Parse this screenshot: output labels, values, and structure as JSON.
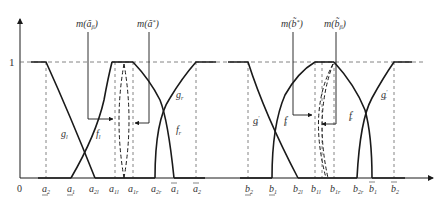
{
  "diagram": {
    "type": "fuzzy-membership-functions",
    "y_axis": {
      "origin_label": "0",
      "one_label": "1"
    },
    "left_panel": {
      "top_labels": [
        {
          "id": "m_a_beta",
          "text": "m(ã",
          "sub": "β",
          "close": ")"
        },
        {
          "id": "m_a_star",
          "text": "m(ã",
          "sup": "*",
          "close": ")"
        }
      ],
      "curve_labels": [
        {
          "id": "g_l",
          "base": "g",
          "sub": "l"
        },
        {
          "id": "f_l",
          "base": "f",
          "sub": "l"
        },
        {
          "id": "g_r",
          "base": "g",
          "sub": "r"
        },
        {
          "id": "f_r",
          "base": "f",
          "sub": "r"
        }
      ],
      "x_ticks": [
        {
          "base": "a",
          "sub": "2",
          "mark": "underline"
        },
        {
          "base": "a",
          "sub": "1",
          "mark": "underline"
        },
        {
          "base": "a",
          "sub": "2l",
          "mark": ""
        },
        {
          "base": "a",
          "sub": "1l",
          "mark": ""
        },
        {
          "base": "a",
          "sub": "1r",
          "mark": ""
        },
        {
          "base": "a",
          "sub": "2r",
          "mark": ""
        },
        {
          "base": "a",
          "sub": "1",
          "mark": "overline"
        },
        {
          "base": "a",
          "sub": "2",
          "mark": "overline"
        }
      ]
    },
    "right_panel": {
      "top_labels": [
        {
          "id": "m_b_star",
          "text": "m(b̃",
          "sup": "*",
          "close": ")"
        },
        {
          "id": "m_b_beta",
          "text": "m(b̃",
          "sub": "β",
          "close": ")"
        }
      ],
      "curve_labels": [
        {
          "id": "g_l_prime",
          "base": "g",
          "sub": "l",
          "prime": "′"
        },
        {
          "id": "f_l_prime",
          "base": "f",
          "sub": "l",
          "prime": "′"
        },
        {
          "id": "f_r_prime",
          "base": "f",
          "sub": "r",
          "prime": "′"
        },
        {
          "id": "g_r_prime",
          "base": "g",
          "sub": "r",
          "prime": "′"
        }
      ],
      "x_ticks": [
        {
          "base": "b",
          "sub": "2",
          "mark": "underline"
        },
        {
          "base": "b",
          "sub": "1",
          "mark": "underline"
        },
        {
          "base": "b",
          "sub": "2l",
          "mark": ""
        },
        {
          "base": "b",
          "sub": "1l",
          "mark": ""
        },
        {
          "base": "b",
          "sub": "1r",
          "mark": ""
        },
        {
          "base": "b",
          "sub": "2r",
          "mark": ""
        },
        {
          "base": "b",
          "sub": "1",
          "mark": "overline"
        },
        {
          "base": "b",
          "sub": "2",
          "mark": "overline"
        }
      ]
    },
    "colors": {
      "line": "#1a1a1a",
      "dashed": "#555555",
      "text": "#333333"
    }
  }
}
